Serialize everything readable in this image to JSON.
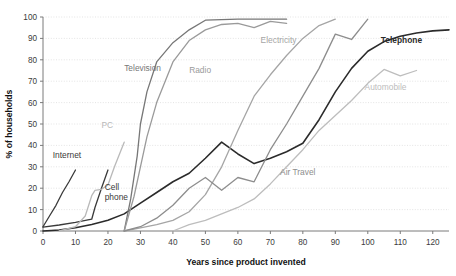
{
  "chart_data": {
    "type": "line",
    "title": "",
    "xlabel": "Years since product invented",
    "ylabel": "% of households",
    "xlim": [
      0,
      125
    ],
    "ylim": [
      0,
      100
    ],
    "xticks": [
      0,
      10,
      20,
      30,
      40,
      50,
      60,
      70,
      80,
      90,
      100,
      110,
      120
    ],
    "yticks": [
      0,
      10,
      20,
      30,
      40,
      50,
      60,
      70,
      80,
      90,
      100
    ],
    "grid": "horizontal-dotted",
    "legend": "inline-labels",
    "series": [
      {
        "name": "Telephone",
        "color": "#2b2b2b",
        "width": 1.6,
        "label_x": 104,
        "label_y": 88,
        "label_anchor": "start",
        "x": [
          0,
          5,
          10,
          15,
          20,
          25,
          30,
          35,
          40,
          45,
          50,
          55,
          60,
          65,
          70,
          75,
          80,
          85,
          90,
          95,
          100,
          105,
          110,
          115,
          120,
          125
        ],
        "y": [
          0,
          0.5,
          1.5,
          3,
          5,
          8,
          13,
          18,
          23,
          27,
          34,
          41.5,
          36,
          31.5,
          34,
          37,
          41,
          52,
          65,
          76,
          84,
          88.5,
          91,
          92.5,
          93.5,
          94
        ]
      },
      {
        "name": "Internet",
        "color": "#3a3a3a",
        "width": 1.3,
        "label_x": 3,
        "label_y": 34,
        "label_anchor": "start",
        "x": [
          0,
          2,
          4,
          6,
          8,
          10
        ],
        "y": [
          2,
          7,
          12,
          18,
          23,
          28.5
        ]
      },
      {
        "name": "Cell phone",
        "color": "#3a3a3a",
        "width": 1.3,
        "label_x": 19,
        "label_y": 19,
        "label_anchor": "start",
        "x": [
          0,
          5,
          10,
          15,
          16,
          18,
          20
        ],
        "y": [
          1.8,
          2.8,
          4,
          5.5,
          11,
          20,
          28.5
        ]
      },
      {
        "name": "PC",
        "color": "#b9b9b9",
        "width": 1.3,
        "label_x": 18,
        "label_y": 48,
        "label_anchor": "start",
        "x": [
          5,
          10,
          13,
          15,
          16,
          18,
          20,
          22,
          25
        ],
        "y": [
          0,
          2,
          7,
          16.5,
          19,
          19.5,
          21.5,
          30,
          41.5
        ]
      },
      {
        "name": "Television",
        "color": "#777777",
        "width": 1.3,
        "label_x": 25,
        "label_y": 75,
        "label_anchor": "start",
        "x": [
          25,
          27,
          29,
          30,
          32,
          35,
          40,
          45,
          50,
          55,
          60,
          65,
          70,
          75
        ],
        "y": [
          0,
          15,
          35,
          50,
          65,
          79,
          88,
          94,
          98.5,
          98.8,
          99,
          99,
          99,
          99
        ]
      },
      {
        "name": "Radio",
        "color": "#9a9a9a",
        "width": 1.3,
        "label_x": 45,
        "label_y": 74,
        "label_anchor": "start",
        "x": [
          25,
          28,
          30,
          32,
          35,
          40,
          45,
          50,
          55,
          60,
          65,
          70,
          75
        ],
        "y": [
          0,
          16,
          30,
          44,
          60,
          79,
          89,
          94,
          96.5,
          97,
          95,
          98,
          97
        ]
      },
      {
        "name": "Electricity",
        "color": "#a5a5a5",
        "width": 1.3,
        "label_x": 67,
        "label_y": 88,
        "label_anchor": "start",
        "x": [
          25,
          30,
          35,
          40,
          45,
          50,
          55,
          60,
          65,
          70,
          75,
          80,
          85,
          90
        ],
        "y": [
          0,
          1.5,
          3,
          5,
          9,
          17,
          30,
          47,
          63,
          73,
          82,
          90,
          96,
          99
        ]
      },
      {
        "name": "Air Travel",
        "color": "#8d8d8d",
        "width": 1.3,
        "label_x": 73,
        "label_y": 26,
        "label_anchor": "start",
        "x": [
          25,
          30,
          35,
          40,
          45,
          50,
          55,
          60,
          65,
          70,
          75,
          80,
          85,
          90,
          95,
          100
        ],
        "y": [
          0,
          2,
          6,
          12,
          20,
          25,
          19,
          25,
          23,
          38,
          50,
          63,
          76,
          92,
          89.5,
          99
        ]
      },
      {
        "name": "Automobile",
        "color": "#bdbdbd",
        "width": 1.3,
        "label_x": 99,
        "label_y": 66,
        "label_anchor": "start",
        "x": [
          40,
          45,
          50,
          55,
          60,
          65,
          70,
          75,
          80,
          85,
          90,
          95,
          100,
          105,
          110,
          115
        ],
        "y": [
          0,
          3,
          5,
          8,
          11,
          15,
          22,
          30,
          38,
          47,
          54,
          61,
          69,
          75.5,
          72.5,
          75
        ]
      }
    ]
  }
}
